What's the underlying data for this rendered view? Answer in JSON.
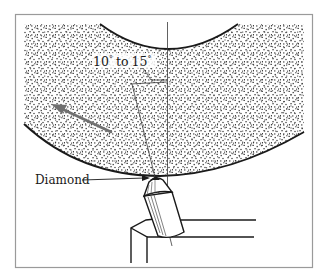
{
  "figure": {
    "labels": {
      "angle": "10° to 15°",
      "angle_parts": {
        "a": "10",
        "deg1": "°",
        "to": "to",
        "b": "15",
        "deg2": "°"
      },
      "tool": "Diamond"
    },
    "colors": {
      "ink": "#1a1a1a",
      "frame": "#9a9a9a",
      "background": "#ffffff",
      "stipple": "#2a2a2a",
      "arrow": "#707070"
    }
  }
}
